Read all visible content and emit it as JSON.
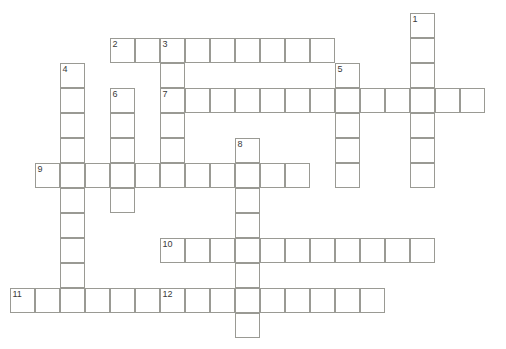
{
  "puzzle": {
    "title": "Crossword Puzzle Grid",
    "cell_size": 25,
    "origin_x": 10,
    "origin_y": 13,
    "grid_columns": 20,
    "grid_rows": 14,
    "colors": {
      "cell_border": "#9a9a94",
      "cell_fill": "#ffffff",
      "background": "#ffffff",
      "number_text": "#3a3a3a"
    },
    "clue_count": 12,
    "across_count": 6,
    "down_count": 6
  },
  "entries": [
    {
      "number": "1",
      "direction": "down",
      "length": 6,
      "start_col": 16,
      "start_row": 0,
      "start_x": 410,
      "start_y": 13
    },
    {
      "number": "2",
      "direction": "across",
      "length": 9,
      "start_col": 4,
      "start_row": 1,
      "start_x": 110,
      "start_y": 38
    },
    {
      "number": "3",
      "direction": "down",
      "length": 6,
      "start_col": 6,
      "start_row": 1,
      "start_x": 160,
      "start_y": 38
    },
    {
      "number": "4",
      "direction": "down",
      "length": 9,
      "start_col": 2,
      "start_row": 2,
      "start_x": 60,
      "start_y": 63
    },
    {
      "number": "5",
      "direction": "down",
      "length": 4,
      "start_col": 13,
      "start_row": 2,
      "start_x": 335,
      "start_y": 63
    },
    {
      "number": "6",
      "direction": "down",
      "length": 5,
      "start_col": 4,
      "start_row": 3,
      "start_x": 110,
      "start_y": 88
    },
    {
      "number": "7",
      "direction": "across",
      "length": 12,
      "start_col": 6,
      "start_row": 3,
      "start_x": 160,
      "start_y": 88
    },
    {
      "number": "8",
      "direction": "down",
      "length": 8,
      "start_col": 9,
      "start_row": 5,
      "start_x": 235,
      "start_y": 138
    },
    {
      "number": "9",
      "direction": "across",
      "length": 11,
      "start_col": 1,
      "start_row": 6,
      "start_x": 35,
      "start_y": 163
    },
    {
      "number": "10",
      "direction": "across",
      "length": 11,
      "start_col": 6,
      "start_row": 9,
      "start_x": 160,
      "start_y": 238
    },
    {
      "number": "11",
      "direction": "across",
      "length": 6,
      "start_col": 0,
      "start_row": 11,
      "start_x": 10,
      "start_y": 288
    },
    {
      "number": "12",
      "direction": "across",
      "length": 9,
      "start_col": 6,
      "start_row": 11,
      "start_x": 160,
      "start_y": 288
    }
  ],
  "cells": [
    {
      "col": 16,
      "row": 0,
      "number": "1"
    },
    {
      "col": 16,
      "row": 1
    },
    {
      "col": 4,
      "row": 1,
      "number": "2"
    },
    {
      "col": 5,
      "row": 1
    },
    {
      "col": 6,
      "row": 1,
      "number": "3"
    },
    {
      "col": 7,
      "row": 1
    },
    {
      "col": 8,
      "row": 1
    },
    {
      "col": 9,
      "row": 1
    },
    {
      "col": 10,
      "row": 1
    },
    {
      "col": 11,
      "row": 1
    },
    {
      "col": 12,
      "row": 1
    },
    {
      "col": 2,
      "row": 2,
      "number": "4"
    },
    {
      "col": 6,
      "row": 2
    },
    {
      "col": 13,
      "row": 2,
      "number": "5"
    },
    {
      "col": 16,
      "row": 2
    },
    {
      "col": 2,
      "row": 3
    },
    {
      "col": 4,
      "row": 3,
      "number": "6"
    },
    {
      "col": 6,
      "row": 3,
      "number": "7"
    },
    {
      "col": 7,
      "row": 3
    },
    {
      "col": 8,
      "row": 3
    },
    {
      "col": 9,
      "row": 3
    },
    {
      "col": 10,
      "row": 3
    },
    {
      "col": 11,
      "row": 3
    },
    {
      "col": 12,
      "row": 3
    },
    {
      "col": 13,
      "row": 3
    },
    {
      "col": 14,
      "row": 3
    },
    {
      "col": 15,
      "row": 3
    },
    {
      "col": 16,
      "row": 3
    },
    {
      "col": 17,
      "row": 3
    },
    {
      "col": 18,
      "row": 3
    },
    {
      "col": 2,
      "row": 4
    },
    {
      "col": 4,
      "row": 4
    },
    {
      "col": 6,
      "row": 4
    },
    {
      "col": 13,
      "row": 4
    },
    {
      "col": 16,
      "row": 4
    },
    {
      "col": 2,
      "row": 5
    },
    {
      "col": 4,
      "row": 5
    },
    {
      "col": 6,
      "row": 5
    },
    {
      "col": 9,
      "row": 5,
      "number": "8"
    },
    {
      "col": 13,
      "row": 5
    },
    {
      "col": 16,
      "row": 5
    },
    {
      "col": 1,
      "row": 6,
      "number": "9"
    },
    {
      "col": 2,
      "row": 6
    },
    {
      "col": 3,
      "row": 6
    },
    {
      "col": 4,
      "row": 6
    },
    {
      "col": 5,
      "row": 6
    },
    {
      "col": 6,
      "row": 6
    },
    {
      "col": 7,
      "row": 6
    },
    {
      "col": 8,
      "row": 6
    },
    {
      "col": 9,
      "row": 6
    },
    {
      "col": 10,
      "row": 6
    },
    {
      "col": 11,
      "row": 6
    },
    {
      "col": 13,
      "row": 6
    },
    {
      "col": 16,
      "row": 6
    },
    {
      "col": 2,
      "row": 7
    },
    {
      "col": 4,
      "row": 7
    },
    {
      "col": 9,
      "row": 7
    },
    {
      "col": 2,
      "row": 8
    },
    {
      "col": 9,
      "row": 8
    },
    {
      "col": 2,
      "row": 9
    },
    {
      "col": 6,
      "row": 9,
      "number": "10"
    },
    {
      "col": 7,
      "row": 9
    },
    {
      "col": 8,
      "row": 9
    },
    {
      "col": 9,
      "row": 9
    },
    {
      "col": 10,
      "row": 9
    },
    {
      "col": 11,
      "row": 9
    },
    {
      "col": 12,
      "row": 9
    },
    {
      "col": 13,
      "row": 9
    },
    {
      "col": 14,
      "row": 9
    },
    {
      "col": 15,
      "row": 9
    },
    {
      "col": 16,
      "row": 9
    },
    {
      "col": 2,
      "row": 10
    },
    {
      "col": 9,
      "row": 10
    },
    {
      "col": 0,
      "row": 11,
      "number": "11"
    },
    {
      "col": 1,
      "row": 11
    },
    {
      "col": 2,
      "row": 11
    },
    {
      "col": 3,
      "row": 11
    },
    {
      "col": 4,
      "row": 11
    },
    {
      "col": 5,
      "row": 11
    },
    {
      "col": 6,
      "row": 11,
      "number": "12"
    },
    {
      "col": 7,
      "row": 11
    },
    {
      "col": 8,
      "row": 11
    },
    {
      "col": 9,
      "row": 11
    },
    {
      "col": 10,
      "row": 11
    },
    {
      "col": 11,
      "row": 11
    },
    {
      "col": 12,
      "row": 11
    },
    {
      "col": 13,
      "row": 11
    },
    {
      "col": 14,
      "row": 11
    },
    {
      "col": 9,
      "row": 12
    }
  ]
}
